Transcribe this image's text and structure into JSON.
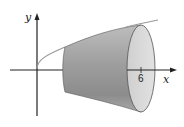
{
  "figure": {
    "axes": {
      "x_label": "x",
      "y_label": "y"
    },
    "ticks": {
      "x_tick_label": "6"
    },
    "colors": {
      "axis": "#222222",
      "curve": "#9a9a9a",
      "solid_dark": "#8a8a8a",
      "solid_light": "#c8c8c8",
      "end_face": "#d9d9d9",
      "background": "#ffffff"
    }
  }
}
